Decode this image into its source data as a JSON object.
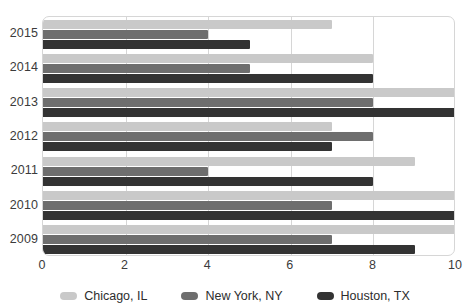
{
  "chart_data": {
    "type": "bar",
    "orientation": "horizontal",
    "title": "",
    "xlabel": "",
    "ylabel": "",
    "categories": [
      "2015",
      "2014",
      "2013",
      "2012",
      "2011",
      "2010",
      "2009"
    ],
    "series": [
      {
        "name": "Chicago, IL",
        "color": "#c9c9c9",
        "values": [
          7,
          8,
          10,
          7,
          9,
          10,
          10
        ]
      },
      {
        "name": "New York, NY",
        "color": "#6e6e6e",
        "values": [
          4,
          5,
          8,
          8,
          4,
          7,
          7
        ]
      },
      {
        "name": "Houston, TX",
        "color": "#333333",
        "values": [
          5,
          8,
          10,
          7,
          8,
          10,
          9
        ]
      }
    ],
    "xlim": [
      0,
      10
    ],
    "xticks": [
      0,
      2,
      4,
      6,
      8,
      10
    ],
    "xtick_labels": [
      "0",
      "2",
      "4",
      "6",
      "8",
      "10"
    ],
    "grid": true,
    "grid_axis": "x",
    "legend_position": "bottom"
  },
  "colors": {
    "chicago": "#c9c9c9",
    "new_york": "#6e6e6e",
    "houston": "#333333",
    "gridline": "#d6d6d6",
    "text": "#3b3b3b",
    "background": "#ffffff"
  }
}
